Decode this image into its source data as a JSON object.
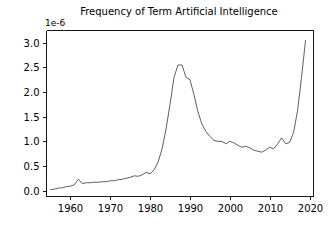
{
  "figure": {
    "background_color": "#ffffff",
    "line_color": "#4d4d4d",
    "axis_color": "#000000"
  },
  "chart_data": {
    "type": "line",
    "title": "Frequency of Term Artificial Intelligence",
    "xlabel": "",
    "ylabel": "",
    "y_offset_label": "1e-6",
    "y_scale": 1e-06,
    "xlim": [
      1954,
      2021
    ],
    "ylim": [
      -0.12,
      3.25
    ],
    "xticks": [
      1960,
      1970,
      1980,
      1990,
      2000,
      2010,
      2020
    ],
    "xticklabels": [
      "1960",
      "1970",
      "1980",
      "1990",
      "2000",
      "2010",
      "2020"
    ],
    "yticks": [
      0.0,
      0.5,
      1.0,
      1.5,
      2.0,
      2.5,
      3.0
    ],
    "yticklabels": [
      "0.0",
      "0.5",
      "1.0",
      "1.5",
      "2.0",
      "2.5",
      "3.0"
    ],
    "grid": false,
    "legend": false,
    "series": [
      {
        "name": "Frequency of Term Artificial Intelligence",
        "x": [
          1955,
          1956,
          1957,
          1958,
          1959,
          1960,
          1961,
          1962,
          1963,
          1964,
          1965,
          1966,
          1967,
          1968,
          1969,
          1970,
          1971,
          1972,
          1973,
          1974,
          1975,
          1976,
          1977,
          1978,
          1979,
          1980,
          1981,
          1982,
          1983,
          1984,
          1985,
          1986,
          1987,
          1988,
          1989,
          1990,
          1991,
          1992,
          1993,
          1994,
          1995,
          1996,
          1997,
          1998,
          1999,
          2000,
          2001,
          2002,
          2003,
          2004,
          2005,
          2006,
          2007,
          2008,
          2009,
          2010,
          2011,
          2012,
          2013,
          2014,
          2015,
          2016,
          2017,
          2018,
          2019
        ],
        "values": [
          0.02,
          0.03,
          0.05,
          0.06,
          0.08,
          0.09,
          0.12,
          0.23,
          0.14,
          0.16,
          0.16,
          0.17,
          0.17,
          0.18,
          0.18,
          0.2,
          0.2,
          0.22,
          0.23,
          0.25,
          0.27,
          0.3,
          0.29,
          0.32,
          0.37,
          0.34,
          0.42,
          0.58,
          0.85,
          1.25,
          1.75,
          2.3,
          2.55,
          2.55,
          2.3,
          2.25,
          1.95,
          1.6,
          1.35,
          1.2,
          1.1,
          1.02,
          1.0,
          1.0,
          0.95,
          1.0,
          0.97,
          0.92,
          0.88,
          0.9,
          0.87,
          0.82,
          0.8,
          0.78,
          0.82,
          0.88,
          0.85,
          0.95,
          1.07,
          0.95,
          0.98,
          1.18,
          1.62,
          2.3,
          3.05
        ]
      }
    ]
  }
}
